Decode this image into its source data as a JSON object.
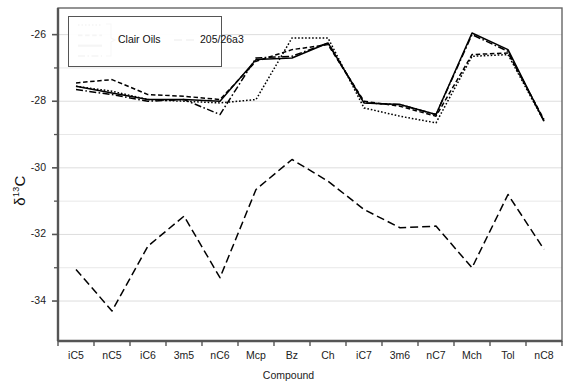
{
  "chart_data": {
    "type": "line",
    "title": "",
    "xlabel": "Compound",
    "ylabel": "δ¹³C",
    "ylabel_base": "δ",
    "ylabel_sup": "13",
    "ylabel_tail": "C",
    "categories": [
      "iC5",
      "nC5",
      "iC6",
      "3m5",
      "nC6",
      "Mcp",
      "Bz",
      "Ch",
      "iC7",
      "3m6",
      "nC7",
      "Mch",
      "Tol",
      "nC8"
    ],
    "ylim": [
      -35.2,
      -25.2
    ],
    "yticks": [
      -26,
      -28,
      -30,
      -32,
      -34
    ],
    "ytick_labels": [
      "-26",
      "-28",
      "-30",
      "-32",
      "-34"
    ],
    "yminor": [
      -27,
      -29,
      -31,
      -33
    ],
    "grid": "horizontal-major-and-minor",
    "legend_position": "upper-left-inside",
    "series": [
      {
        "name": "Clair Oil 1",
        "group": "Clair Oils",
        "style": "dotted",
        "values": [
          -27.55,
          -27.7,
          -27.95,
          -28.0,
          -28.05,
          -27.95,
          -26.1,
          -26.1,
          -28.2,
          -28.45,
          -28.65,
          -26.65,
          -26.6,
          -28.6
        ]
      },
      {
        "name": "Clair Oil 2",
        "group": "Clair Oils",
        "style": "dashed",
        "values": [
          -27.45,
          -27.35,
          -27.8,
          -27.85,
          -27.95,
          -26.8,
          -26.45,
          -26.3,
          -28.0,
          -28.15,
          -28.45,
          -26.6,
          -26.55,
          -28.55
        ]
      },
      {
        "name": "Clair Oil 3",
        "group": "Clair Oils",
        "style": "solid",
        "values": [
          -27.55,
          -27.75,
          -27.95,
          -27.95,
          -28.0,
          -26.75,
          -26.7,
          -26.25,
          -28.05,
          -28.1,
          -28.4,
          -25.95,
          -26.45,
          -28.6
        ]
      },
      {
        "name": "Clair Oil 4",
        "group": "Clair Oils",
        "style": "dashdot",
        "values": [
          -27.65,
          -27.8,
          -28.0,
          -27.95,
          -28.4,
          -26.7,
          -26.65,
          -26.25,
          -28.05,
          -28.1,
          -28.4,
          -26.0,
          -26.5,
          -28.6
        ]
      },
      {
        "name": "205/26a3",
        "group": "205/26a3",
        "style": "long-dashed",
        "values": [
          -33.05,
          -34.3,
          -32.35,
          -31.45,
          -33.3,
          -30.65,
          -29.75,
          -30.4,
          -31.25,
          -31.8,
          -31.75,
          -33.0,
          -30.8,
          -32.45
        ]
      }
    ],
    "legend": {
      "group_label": "Clair Oils",
      "group_entries": [
        "dotted",
        "dashed",
        "solid",
        "dashdot"
      ],
      "single_label": "205/26a3",
      "single_style": "long-dashed"
    },
    "colors": {
      "line": "#000000",
      "axis": "#555555",
      "grid": "#e8e8e8",
      "background": "#ffffff"
    }
  }
}
